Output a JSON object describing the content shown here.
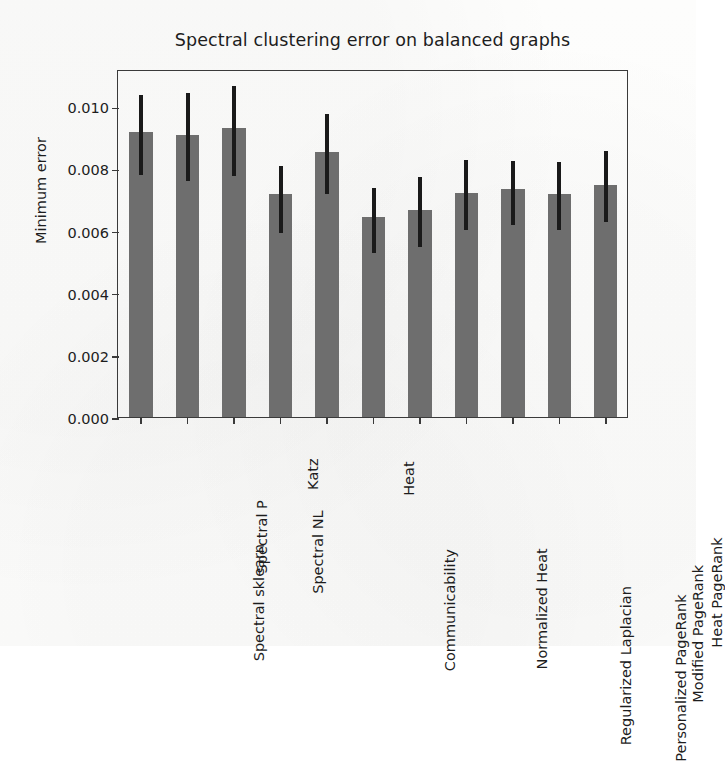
{
  "chart_data": {
    "type": "bar",
    "title": "Spectral clustering error on balanced graphs",
    "xlabel": "",
    "ylabel": "Minimum error",
    "ylim": [
      0.0,
      0.0112
    ],
    "yticks": [
      0.0,
      0.002,
      0.004,
      0.006,
      0.008,
      0.01
    ],
    "ytick_labels": [
      "0.000",
      "0.002",
      "0.004",
      "0.006",
      "0.008",
      "0.010"
    ],
    "grid": false,
    "legend": null,
    "bar_color": "#6e6e6e",
    "error_color": "#1a1a1a",
    "categories": [
      "Spectral sklearn",
      "Spectral P",
      "Spectral NL",
      "Katz",
      "Communicability",
      "Heat",
      "Normalized Heat",
      "Regularized Laplacian",
      "Personalized PageRank",
      "Modified PageRank",
      "Heat PageRank"
    ],
    "values": [
      0.00917,
      0.00908,
      0.0093,
      0.00718,
      0.00853,
      0.00645,
      0.00665,
      0.0072,
      0.00733,
      0.00718,
      0.00747
    ],
    "error_low": [
      0.00785,
      0.00765,
      0.00782,
      0.006,
      0.00723,
      0.00535,
      0.00553,
      0.00607,
      0.00625,
      0.00608,
      0.00635
    ],
    "error_high": [
      0.01042,
      0.0105,
      0.01072,
      0.00815,
      0.00982,
      0.00745,
      0.0078,
      0.00832,
      0.0083,
      0.00828,
      0.00862
    ]
  }
}
